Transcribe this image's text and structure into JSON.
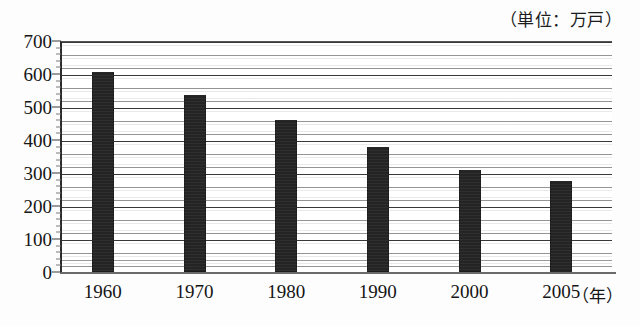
{
  "caption": {
    "unit_note": "（単位：万戸）",
    "x_axis_unit": "（年）"
  },
  "chart_data": {
    "type": "bar",
    "title": "",
    "subtitle": "",
    "xlabel": "（年）",
    "ylabel": "",
    "unit": "万戸",
    "categories": [
      "1960",
      "1970",
      "1980",
      "1990",
      "2000",
      "2005"
    ],
    "values": [
      605,
      535,
      462,
      380,
      308,
      277
    ],
    "series": [
      {
        "name": "戸数",
        "values": [
          605,
          535,
          462,
          380,
          308,
          277
        ]
      }
    ],
    "ylim": [
      0,
      700
    ],
    "y_ticks": [
      0,
      100,
      200,
      300,
      400,
      500,
      600,
      700
    ],
    "y_tick_labels": [
      "0",
      "100",
      "200",
      "300",
      "400",
      "500",
      "600",
      "700"
    ],
    "y_minor_step": 20,
    "grid": true,
    "grid_orientation": "horizontal",
    "legend": false,
    "legend_position": "none",
    "bar_color": "#242424",
    "grid_color": "#464646",
    "axis_color": "#2b2b2b",
    "annotations": [
      "（単位：万戸）"
    ]
  }
}
